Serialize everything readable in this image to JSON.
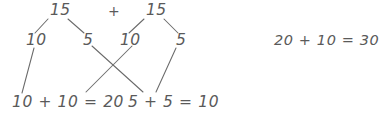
{
  "worksheet": {
    "ink_color": "#5a5a5a",
    "background_color": "#ffffff",
    "operator": "+",
    "bond_left": {
      "total": "15",
      "part_left": "10",
      "part_right": "5"
    },
    "bond_right": {
      "total": "15",
      "part_left": "10",
      "part_right": "5"
    },
    "equations": {
      "tens": "10 + 10 = 20",
      "ones": "5 + 5 = 10",
      "final": "20 + 10 = 30"
    }
  }
}
